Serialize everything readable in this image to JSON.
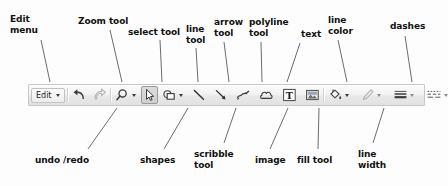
{
  "diagram": {
    "ink_color": "#111111",
    "leader_color": "#5a5a66",
    "toolbar_bg": "#eeeeee",
    "toolbar_border": "#c8c8c8"
  },
  "toolbar": {
    "edit_menu": {
      "label": "Edit",
      "has_caret": true
    },
    "buttons": [
      {
        "id": "undo",
        "icon": "undo-icon",
        "caret": false,
        "active": false
      },
      {
        "id": "redo",
        "icon": "redo-icon",
        "caret": false,
        "active": false
      },
      {
        "id": "zoom",
        "icon": "magnifier-icon",
        "caret": true,
        "active": false
      },
      {
        "id": "select",
        "icon": "cursor-icon",
        "caret": false,
        "active": true
      },
      {
        "id": "shapes",
        "icon": "shapes-icon",
        "caret": true,
        "active": false
      },
      {
        "id": "line",
        "icon": "line-icon",
        "caret": false,
        "active": false
      },
      {
        "id": "arrow",
        "icon": "arrow-icon",
        "caret": false,
        "active": false
      },
      {
        "id": "scribble",
        "icon": "scribble-icon",
        "caret": false,
        "active": false
      },
      {
        "id": "polyline",
        "icon": "cloud-icon",
        "caret": false,
        "active": false
      },
      {
        "id": "text",
        "icon": "text-t-icon",
        "caret": false,
        "active": false
      },
      {
        "id": "image",
        "icon": "image-icon",
        "caret": false,
        "active": false
      },
      {
        "id": "fill",
        "icon": "paint-bucket-icon",
        "caret": true,
        "active": false
      },
      {
        "id": "linecolor",
        "icon": "pencil-icon",
        "caret": true,
        "active": false
      },
      {
        "id": "linewidth",
        "icon": "line-width-icon",
        "caret": true,
        "active": false
      },
      {
        "id": "dashes",
        "icon": "dashes-icon",
        "caret": true,
        "active": false
      }
    ]
  },
  "annotations": {
    "top": [
      {
        "id": "edit-menu",
        "text": "Edit\nmenu",
        "x": 10,
        "y": 14,
        "line": {
          "x1": 41,
          "y1": 40,
          "x2": 50,
          "y2": 82
        }
      },
      {
        "id": "zoom-tool",
        "text": "Zoom tool",
        "x": 78,
        "y": 16,
        "line": {
          "x1": 110,
          "y1": 30,
          "x2": 122,
          "y2": 82
        }
      },
      {
        "id": "select-tool",
        "text": "select tool",
        "x": 128,
        "y": 27,
        "line": {
          "x1": 160,
          "y1": 40,
          "x2": 162,
          "y2": 82
        }
      },
      {
        "id": "line-tool",
        "text": "line\ntool",
        "x": 186,
        "y": 24,
        "line": {
          "x1": 196,
          "y1": 48,
          "x2": 198,
          "y2": 82
        }
      },
      {
        "id": "arrow-tool",
        "text": "arrow\ntool",
        "x": 214,
        "y": 17,
        "line": {
          "x1": 224,
          "y1": 42,
          "x2": 229,
          "y2": 82
        }
      },
      {
        "id": "polyline-tool",
        "text": "polyline\ntool",
        "x": 249,
        "y": 17,
        "line": {
          "x1": 261,
          "y1": 42,
          "x2": 262,
          "y2": 82
        }
      },
      {
        "id": "text-tool",
        "text": "text",
        "x": 301,
        "y": 29,
        "line": {
          "x1": 300,
          "y1": 43,
          "x2": 287,
          "y2": 82
        }
      },
      {
        "id": "line-color",
        "text": "line\ncolor",
        "x": 328,
        "y": 15,
        "line": {
          "x1": 338,
          "y1": 40,
          "x2": 347,
          "y2": 82
        }
      },
      {
        "id": "dashes",
        "text": "dashes",
        "x": 390,
        "y": 21,
        "line": {
          "x1": 405,
          "y1": 36,
          "x2": 412,
          "y2": 82
        }
      }
    ],
    "bottom": [
      {
        "id": "undo-redo",
        "text": "undo /redo",
        "x": 35,
        "y": 155,
        "line": {
          "x1": 88,
          "y1": 149,
          "x2": 117,
          "y2": 108
        }
      },
      {
        "id": "shapes",
        "text": "shapes",
        "x": 140,
        "y": 155,
        "line": {
          "x1": 164,
          "y1": 149,
          "x2": 188,
          "y2": 108
        }
      },
      {
        "id": "scribble-tool",
        "text": "scribble\ntool",
        "x": 194,
        "y": 149,
        "line": {
          "x1": 224,
          "y1": 143,
          "x2": 236,
          "y2": 108
        }
      },
      {
        "id": "image",
        "text": "image",
        "x": 255,
        "y": 155,
        "line": {
          "x1": 270,
          "y1": 149,
          "x2": 288,
          "y2": 108
        }
      },
      {
        "id": "fill-tool",
        "text": "fill tool",
        "x": 297,
        "y": 155,
        "line": {
          "x1": 318,
          "y1": 149,
          "x2": 319,
          "y2": 108
        }
      },
      {
        "id": "line-width",
        "text": "line\nwidth",
        "x": 358,
        "y": 149,
        "line": {
          "x1": 373,
          "y1": 143,
          "x2": 384,
          "y2": 108
        }
      }
    ]
  }
}
